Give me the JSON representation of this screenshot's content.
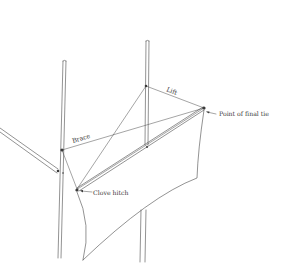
{
  "figure": {
    "type": "line-drawing",
    "colors": {
      "background": "#ffffff",
      "ink": "#4a4a4a"
    }
  },
  "labels": {
    "lift": "Lift",
    "final_tie": "Point of final tie",
    "brace": "Brace",
    "clove_hitch": "Clove hitch"
  }
}
